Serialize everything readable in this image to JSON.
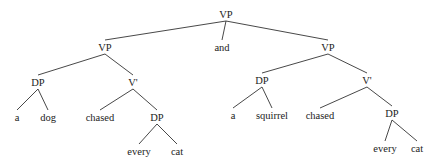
{
  "diagram": {
    "type": "syntax-tree",
    "nodes": {
      "root": {
        "label": "VP",
        "x": 226,
        "y": 18
      },
      "and": {
        "label": "and",
        "x": 222,
        "y": 51
      },
      "vp_left": {
        "label": "VP",
        "x": 105,
        "y": 51
      },
      "vp_right": {
        "label": "VP",
        "x": 328,
        "y": 51
      },
      "dp_l1": {
        "label": "DP",
        "x": 38,
        "y": 86
      },
      "a_l": {
        "label": "a",
        "x": 17,
        "y": 121
      },
      "dog": {
        "label": "dog",
        "x": 48,
        "y": 121
      },
      "vbar_l": {
        "label": "V'",
        "x": 133,
        "y": 86
      },
      "chased_l": {
        "label": "chased",
        "x": 100,
        "y": 121
      },
      "dp_l2": {
        "label": "DP",
        "x": 157,
        "y": 121
      },
      "every_l": {
        "label": "every",
        "x": 139,
        "y": 155
      },
      "cat_l": {
        "label": "cat",
        "x": 177,
        "y": 155
      },
      "dp_r1": {
        "label": "DP",
        "x": 262,
        "y": 84
      },
      "a_r": {
        "label": "a",
        "x": 233,
        "y": 119
      },
      "squirrel": {
        "label": "squirrel",
        "x": 272,
        "y": 119
      },
      "vbar_r": {
        "label": "V'",
        "x": 367,
        "y": 84
      },
      "chased_r": {
        "label": "chased",
        "x": 320,
        "y": 119
      },
      "dp_r2": {
        "label": "DP",
        "x": 392,
        "y": 117
      },
      "every_r": {
        "label": "every",
        "x": 385,
        "y": 152
      },
      "cat_r": {
        "label": "cat",
        "x": 417,
        "y": 152
      }
    },
    "edges": [
      [
        "root",
        "vp_left"
      ],
      [
        "root",
        "and"
      ],
      [
        "root",
        "vp_right"
      ],
      [
        "vp_left",
        "dp_l1"
      ],
      [
        "vp_left",
        "vbar_l"
      ],
      [
        "dp_l1",
        "a_l"
      ],
      [
        "dp_l1",
        "dog"
      ],
      [
        "vbar_l",
        "chased_l"
      ],
      [
        "vbar_l",
        "dp_l2"
      ],
      [
        "dp_l2",
        "every_l"
      ],
      [
        "dp_l2",
        "cat_l"
      ],
      [
        "vp_right",
        "dp_r1"
      ],
      [
        "vp_right",
        "vbar_r"
      ],
      [
        "dp_r1",
        "a_r"
      ],
      [
        "dp_r1",
        "squirrel"
      ],
      [
        "vbar_r",
        "chased_r"
      ],
      [
        "vbar_r",
        "dp_r2"
      ],
      [
        "dp_r2",
        "every_r"
      ],
      [
        "dp_r2",
        "cat_r"
      ]
    ]
  }
}
